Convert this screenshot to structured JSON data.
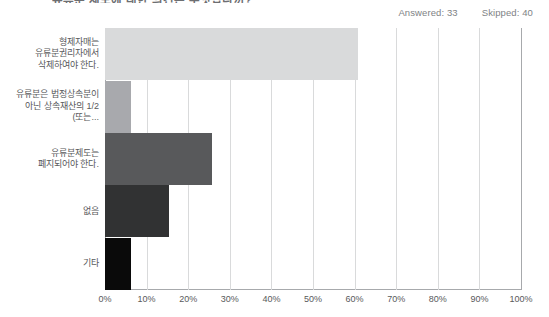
{
  "header": {
    "title_clipped": "유류분 제도에 대한 의견은 무엇입니까?",
    "answered_label": "Answered: 33",
    "skipped_label": "Skipped: 40"
  },
  "chart_data": {
    "type": "bar",
    "orientation": "horizontal",
    "title": "유류분 제도에 대한 의견은 무엇입니까?",
    "xlabel": "",
    "ylabel": "",
    "xlim": [
      0,
      100
    ],
    "grid": true,
    "legend": "none",
    "categories": [
      "형제자매는\n유류분권리자에서\n삭제하여야 한다.",
      "유류분은 법정상속분이\n아닌 상속재산의 1/2\n(또는...",
      "유류분제도는\n폐지되어야 한다.",
      "없음",
      "기타"
    ],
    "values": [
      60.7,
      6.2,
      25.7,
      15.4,
      6.2
    ],
    "value_unit": "%",
    "bar_colors": [
      "#d9dadb",
      "#a8a9ad",
      "#58595b",
      "#313233",
      "#0a0a0a"
    ],
    "tick_labels": [
      "0%",
      "10%",
      "20%",
      "30%",
      "40%",
      "50%",
      "60%",
      "70%",
      "80%",
      "90%",
      "100%"
    ],
    "tick_values": [
      0,
      10,
      20,
      30,
      40,
      50,
      60,
      70,
      80,
      90,
      100
    ],
    "axis_color": "#a7a9ac",
    "grid_color": "#d9dadb"
  }
}
